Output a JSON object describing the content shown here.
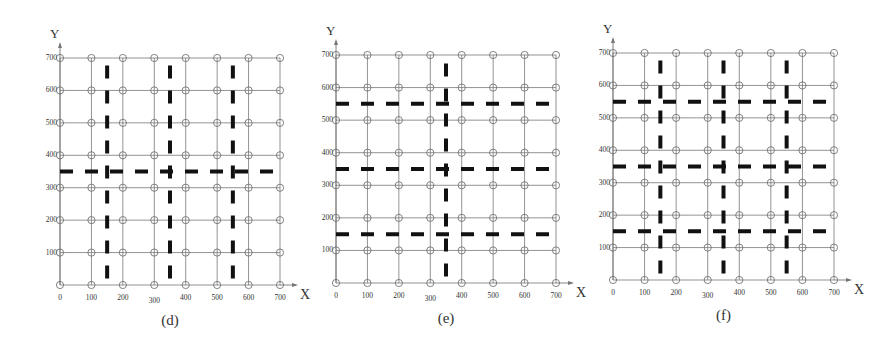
{
  "figure": {
    "axis_labels": {
      "x": "X",
      "y": "Y"
    },
    "tick_values": [
      0,
      100,
      200,
      300,
      400,
      500,
      600,
      700
    ],
    "panels": [
      {
        "id": "d",
        "caption": "(d)",
        "frame": {
          "x0": 60,
          "x1": 280,
          "y0": 285,
          "y1": 58
        },
        "vertical_dashed_x": [
          150,
          350,
          550
        ],
        "horizontal_dashed_y": [
          350
        ]
      },
      {
        "id": "e",
        "caption": "(e)",
        "frame": {
          "x0": 336,
          "x1": 556,
          "y0": 283,
          "y1": 55
        },
        "vertical_dashed_x": [
          350
        ],
        "horizontal_dashed_y": [
          150,
          350,
          550
        ]
      },
      {
        "id": "f",
        "caption": "(f)",
        "frame": {
          "x0": 613,
          "x1": 834,
          "y0": 280,
          "y1": 53
        },
        "vertical_dashed_x": [
          150,
          350,
          550
        ],
        "horizontal_dashed_y": [
          150,
          350,
          550
        ]
      }
    ]
  },
  "colors": {
    "grid": "#777777",
    "dash": "#111111",
    "node": "#666666",
    "text": "#333333"
  }
}
